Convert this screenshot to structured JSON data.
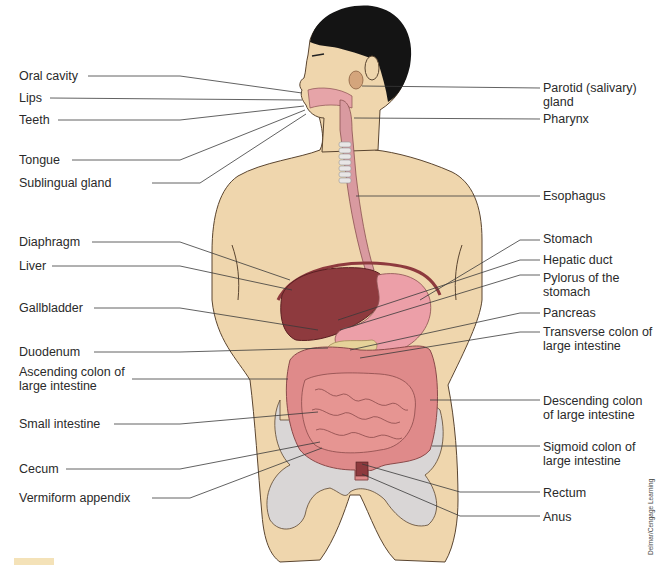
{
  "diagram": {
    "colors": {
      "skin": "#efd6ad",
      "skin_outline": "#5a4530",
      "hair": "#141414",
      "liver": "#8e3a3e",
      "stomach": "#ec9fa8",
      "intestine": "#e69592",
      "colon": "#df8a8a",
      "pancreas": "#e6d39a",
      "bone": "#d9d6d6",
      "esophagus": "#d99aa0",
      "trachea": "#e8e6e6",
      "leader_line": "#3a3a3a"
    },
    "labels_left": [
      {
        "id": "oral-cavity",
        "text": "Oral cavity"
      },
      {
        "id": "lips",
        "text": "Lips"
      },
      {
        "id": "teeth",
        "text": "Teeth"
      },
      {
        "id": "tongue",
        "text": "Tongue"
      },
      {
        "id": "sublingual-gland",
        "text": "Sublingual gland"
      },
      {
        "id": "diaphragm",
        "text": "Diaphragm"
      },
      {
        "id": "liver",
        "text": "Liver"
      },
      {
        "id": "gallbladder",
        "text": "Gallbladder"
      },
      {
        "id": "duodenum",
        "text": "Duodenum"
      },
      {
        "id": "ascending-colon",
        "text": "Ascending colon of large intestine"
      },
      {
        "id": "small-intestine",
        "text": "Small intestine"
      },
      {
        "id": "cecum",
        "text": "Cecum"
      },
      {
        "id": "vermiform-appendix",
        "text": "Vermiform appendix"
      }
    ],
    "labels_right": [
      {
        "id": "parotid-gland",
        "text": "Parotid (salivary) gland"
      },
      {
        "id": "pharynx",
        "text": "Pharynx"
      },
      {
        "id": "esophagus",
        "text": "Esophagus"
      },
      {
        "id": "stomach",
        "text": "Stomach"
      },
      {
        "id": "hepatic-duct",
        "text": "Hepatic duct"
      },
      {
        "id": "pylorus",
        "text": "Pylorus of the stomach"
      },
      {
        "id": "pancreas",
        "text": "Pancreas"
      },
      {
        "id": "transverse-colon",
        "text": "Transverse colon of large intestine"
      },
      {
        "id": "descending-colon",
        "text": "Descending colon of large intestine"
      },
      {
        "id": "sigmoid-colon",
        "text": "Sigmoid colon of large intestine"
      },
      {
        "id": "rectum",
        "text": "Rectum"
      },
      {
        "id": "anus",
        "text": "Anus"
      }
    ],
    "credit": "Delmar/Cengage Learning"
  }
}
